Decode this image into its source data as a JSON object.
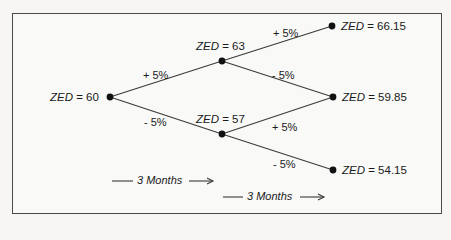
{
  "diagram": {
    "type": "binomial-tree",
    "variable": "ZED",
    "nodes": {
      "root": {
        "label": "ZED",
        "value": "= 60"
      },
      "up": {
        "label": "ZED",
        "value": "= 63"
      },
      "down": {
        "label": "ZED",
        "value": "= 57"
      },
      "up_up": {
        "label": "ZED",
        "value": "= 66.15"
      },
      "up_down": {
        "label": "ZED",
        "value": "= 59.85"
      },
      "down_down": {
        "label": "ZED",
        "value": "= 54.15"
      }
    },
    "edges": {
      "root_up": "+ 5%",
      "root_down": "- 5%",
      "up_up": "+ 5%",
      "up_down": "- 5%",
      "down_up": "+ 5%",
      "down_down": "- 5%"
    },
    "periods": [
      "3 Months",
      "3 Months"
    ],
    "colors": {
      "line": "#3a3a3a",
      "node": "#111111",
      "frame": "#4a4a4a"
    }
  }
}
